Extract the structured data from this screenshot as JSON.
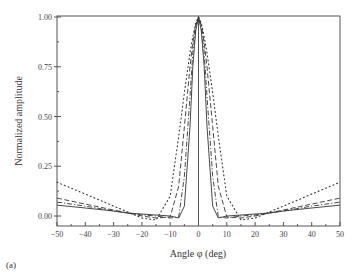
{
  "chart_data": {
    "type": "line",
    "title": "",
    "xlabel": "Angle φ (deg)",
    "ylabel": "Normalized amplitude",
    "xlim": [
      -50,
      50
    ],
    "ylim": [
      -0.05,
      1.0
    ],
    "xticks": [
      -50,
      -40,
      -30,
      -20,
      -10,
      0,
      10,
      20,
      30,
      40,
      50
    ],
    "yticks": [
      "0.00",
      "0.25",
      "0.50",
      "0.75",
      "1.00"
    ],
    "grid": false,
    "legend": "none",
    "panel_label": "(a)",
    "x": [
      -50,
      -40,
      -30,
      -25,
      -20,
      -15,
      -10,
      -7,
      -5,
      -3,
      -2,
      -1,
      0,
      1,
      2,
      3,
      5,
      7,
      10,
      15,
      20,
      25,
      30,
      40,
      50
    ],
    "series": [
      {
        "name": "solid",
        "style": "solid",
        "values": [
          0.055,
          0.04,
          0.025,
          0.015,
          0.01,
          0.005,
          0.0,
          -0.01,
          0.05,
          0.45,
          0.75,
          0.93,
          1.0,
          0.93,
          0.75,
          0.45,
          0.05,
          -0.01,
          0.0,
          0.005,
          0.01,
          0.015,
          0.025,
          0.04,
          0.055
        ]
      },
      {
        "name": "dash-dot",
        "style": "dashdot",
        "values": [
          0.07,
          0.05,
          0.025,
          0.015,
          0.005,
          0.0,
          -0.01,
          -0.005,
          0.2,
          0.6,
          0.82,
          0.95,
          1.0,
          0.95,
          0.82,
          0.6,
          0.2,
          -0.005,
          -0.01,
          0.0,
          0.005,
          0.015,
          0.025,
          0.05,
          0.07
        ]
      },
      {
        "name": "dashed",
        "style": "dashed",
        "values": [
          0.09,
          0.06,
          0.03,
          0.015,
          0.0,
          -0.01,
          -0.005,
          0.15,
          0.45,
          0.75,
          0.87,
          0.96,
          1.0,
          0.96,
          0.87,
          0.75,
          0.45,
          0.15,
          -0.005,
          -0.01,
          0.0,
          0.015,
          0.03,
          0.06,
          0.09
        ]
      },
      {
        "name": "dotted",
        "style": "dotted",
        "values": [
          0.17,
          0.11,
          0.05,
          0.02,
          -0.01,
          -0.02,
          0.1,
          0.4,
          0.62,
          0.82,
          0.9,
          0.97,
          1.0,
          0.97,
          0.9,
          0.82,
          0.62,
          0.4,
          0.1,
          -0.02,
          -0.01,
          0.02,
          0.05,
          0.11,
          0.17
        ]
      }
    ]
  }
}
